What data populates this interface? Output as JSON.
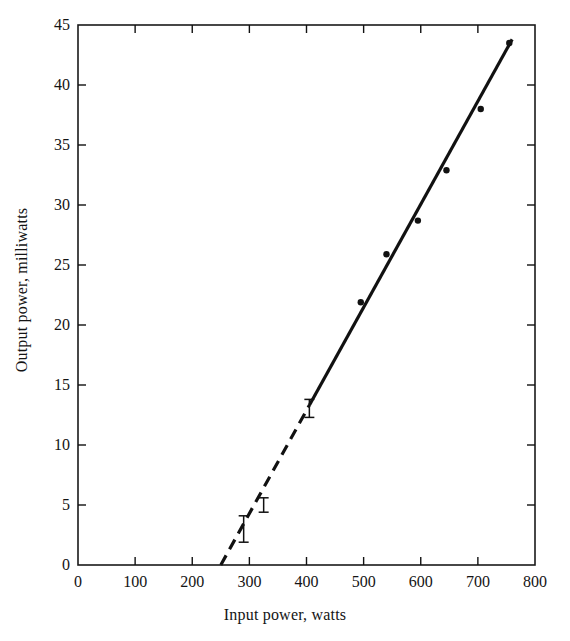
{
  "chart_data": {
    "type": "scatter",
    "title": "",
    "xlabel": "Input power, watts",
    "ylabel": "Output power, milliwatts",
    "xlim": [
      0,
      800
    ],
    "ylim": [
      0,
      45
    ],
    "xticks": [
      0,
      100,
      200,
      300,
      400,
      500,
      600,
      700,
      800
    ],
    "yticks": [
      0,
      5,
      10,
      15,
      20,
      25,
      30,
      35,
      40,
      45
    ],
    "xtick_labels": [
      "0",
      "100",
      "200",
      "300",
      "400",
      "500",
      "600",
      "700",
      "800"
    ],
    "ytick_labels": [
      "0",
      "5",
      "10",
      "15",
      "20",
      "25",
      "30",
      "35",
      "40",
      "45"
    ],
    "grid": false,
    "legend": "none",
    "frame": "box",
    "tick_direction": "in",
    "marker_color": "#111111",
    "line_color": "#111111",
    "points": [
      {
        "x": 495,
        "y": 21.9
      },
      {
        "x": 540,
        "y": 25.9
      },
      {
        "x": 595,
        "y": 28.7
      },
      {
        "x": 645,
        "y": 32.9
      },
      {
        "x": 705,
        "y": 38.0
      },
      {
        "x": 755,
        "y": 43.5
      }
    ],
    "error_bars": [
      {
        "x": 290,
        "y": 3.0,
        "ylow": 1.9,
        "yhigh": 4.1
      },
      {
        "x": 325,
        "y": 5.0,
        "ylow": 4.4,
        "yhigh": 5.6
      },
      {
        "x": 405,
        "y": 13.0,
        "ylow": 12.3,
        "yhigh": 13.8
      }
    ],
    "fit_line": {
      "label": "threshold fit",
      "x_start": 250,
      "y_start": 0,
      "x_end": 760,
      "y_end": 43.8,
      "dashed_segment": {
        "x_start": 250,
        "x_end": 405
      },
      "solid_segment": {
        "x_start": 405,
        "x_end": 760
      },
      "slope_mw_per_w": 0.0859,
      "threshold_watts": 250
    },
    "annotations": []
  },
  "figure": {
    "background_color": "#ffffff",
    "axis_color": "#1a1a1a"
  }
}
